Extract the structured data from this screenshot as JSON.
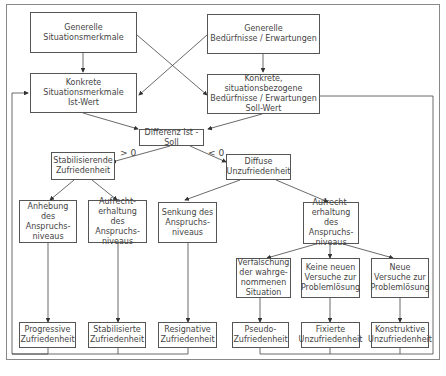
{
  "nodes": {
    "general_situation": "Generelle\nSituationsmerkmale",
    "general_needs": "Generelle\nBedürfnisse / Erwartungen",
    "concrete_situation": "Konkrete\nSituationsmerkmale\nIst-Wert",
    "concrete_needs": "Konkrete, situationsbezogene\nBedürfnisse / Erwartungen\nSoll-Wert",
    "difference": "Differenz Ist - Soll",
    "stabilizing": "Stabilisierende\nZufriedenheit",
    "diffuse": "Diffuse\nUnzufriedenheit",
    "raise_level": "Anhebung des\nAnspruchs-\nniveaus",
    "maintain_level_1": "Aufrecht-\nerhaltung des\nAnspruchs-\nniveaus",
    "lower_level": "Senkung des\nAnspruchs-\nniveaus",
    "maintain_level_2": "Aufrecht-\nerhaltung des\nAnspruchs-\nniveaus",
    "distortion": "Verfälschung\nder wahrge-\nnommenen\nSituation",
    "no_new_attempts": "Keine neuen\nVersuche zur\nProblemlösung",
    "new_attempts": "Neue\nVersuche zur\nProblemlösung",
    "progressive": "Progressive\nZufriedenheit",
    "stabilized": "Stabilisierte\nZufriedenheit",
    "resignative": "Resignative\nZufriedenheit",
    "pseudo": "Pseudo-\nZufriedenheit",
    "fixed": "Fixierte\nUnzufriedenheit",
    "constructive": "Konstruktive\nUnzufriedenheit"
  },
  "edge_labels": {
    "greater": "> 0",
    "less": "< 0"
  }
}
